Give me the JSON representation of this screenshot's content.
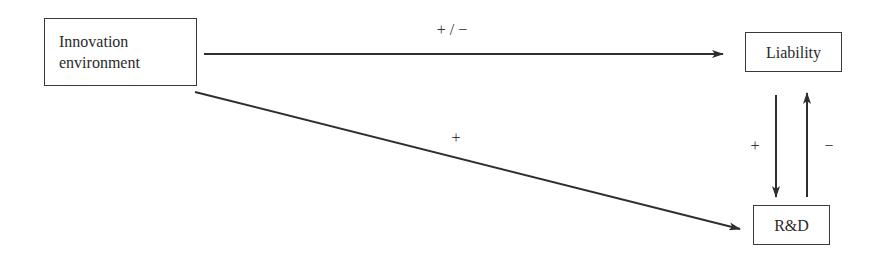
{
  "nodes": {
    "innovation": {
      "line1": "Innovation",
      "line2": "environment"
    },
    "liability": {
      "label": "Liability"
    },
    "rd": {
      "label": "R&D"
    }
  },
  "edges": {
    "innovation_to_liability": {
      "sign": "+ / −"
    },
    "innovation_to_rd": {
      "sign": "+"
    },
    "liability_to_rd": {
      "sign": "+"
    },
    "rd_to_liability": {
      "sign": "−"
    }
  },
  "colors": {
    "line": "#2e2e2e",
    "background": "#ffffff"
  }
}
